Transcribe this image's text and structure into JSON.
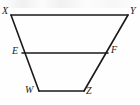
{
  "figure": {
    "shape_type": "trapezoid",
    "background_color": "#fefefe",
    "stroke_color": "#1a1a1a",
    "stroke_width": 1.6,
    "canvas": {
      "width": 140,
      "height": 105
    },
    "points": {
      "X": {
        "x": 11,
        "y": 15
      },
      "Y": {
        "x": 128,
        "y": 15
      },
      "E": {
        "x": 22,
        "y": 53
      },
      "F": {
        "x": 108,
        "y": 53
      },
      "W": {
        "x": 39,
        "y": 91
      },
      "Z": {
        "x": 84,
        "y": 91
      }
    },
    "segments": [
      {
        "name": "segment-XY",
        "from": "X",
        "to": "Y"
      },
      {
        "name": "segment-XW",
        "from": "X",
        "to": "W"
      },
      {
        "name": "segment-YZ",
        "from": "Y",
        "to": "Z"
      },
      {
        "name": "segment-WZ",
        "from": "W",
        "to": "Z"
      },
      {
        "name": "segment-EF",
        "from": "E",
        "to": "F"
      }
    ],
    "labels": {
      "X": {
        "text": "X",
        "x": 2,
        "y": 6
      },
      "Y": {
        "text": "Y",
        "x": 130,
        "y": 6
      },
      "E": {
        "text": "E",
        "x": 12,
        "y": 46
      },
      "F": {
        "text": "F",
        "x": 111,
        "y": 45
      },
      "W": {
        "text": "W",
        "x": 25,
        "y": 85
      },
      "Z": {
        "text": "Z",
        "x": 86,
        "y": 86
      }
    }
  }
}
